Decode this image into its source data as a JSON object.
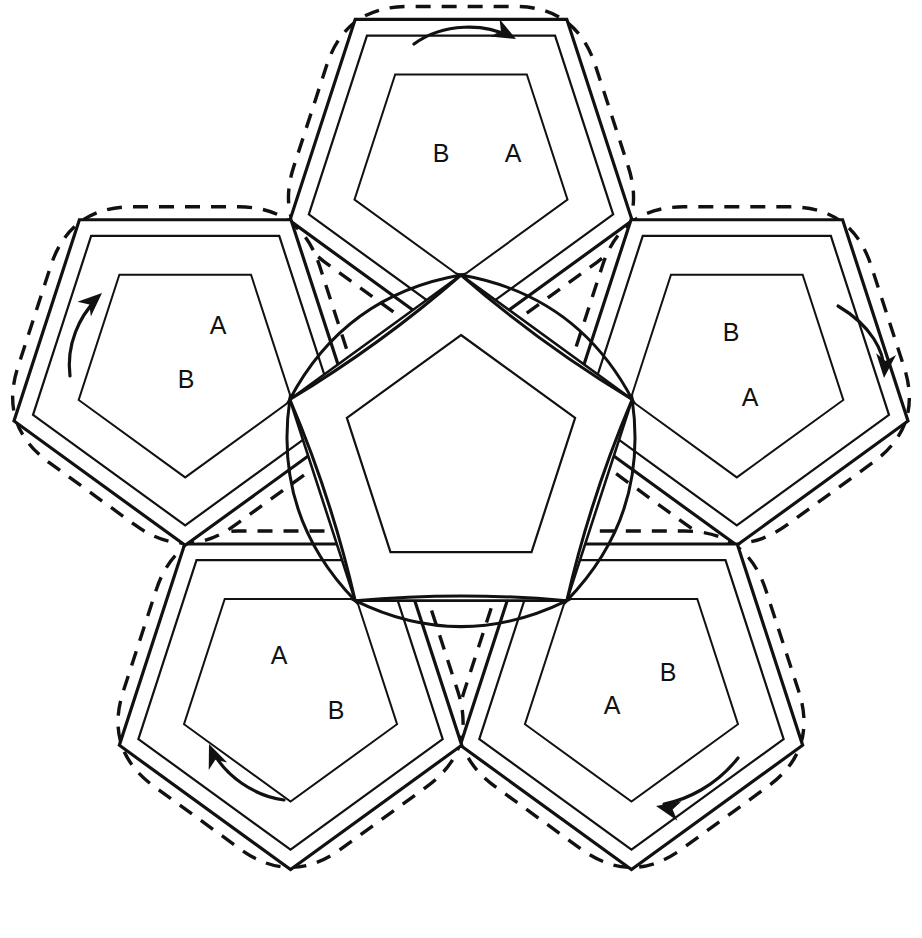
{
  "figure": {
    "background": "#ffffff",
    "stroke_color": "#111111",
    "module_count": 5,
    "arrow_count": 5,
    "label_text": {
      "a": "A",
      "b": "B"
    }
  },
  "labels": [
    {
      "id": "l1",
      "text": "B",
      "x": 441,
      "y": 155
    },
    {
      "id": "l2",
      "text": "A",
      "x": 513,
      "y": 155
    },
    {
      "id": "l3",
      "text": "A",
      "x": 218,
      "y": 327
    },
    {
      "id": "l4",
      "text": "B",
      "x": 186,
      "y": 381
    },
    {
      "id": "l5",
      "text": "B",
      "x": 731,
      "y": 334
    },
    {
      "id": "l6",
      "text": "A",
      "x": 750,
      "y": 399
    },
    {
      "id": "l7",
      "text": "A",
      "x": 279,
      "y": 657
    },
    {
      "id": "l8",
      "text": "B",
      "x": 336,
      "y": 712
    },
    {
      "id": "l9",
      "text": "B",
      "x": 668,
      "y": 674
    },
    {
      "id": "l10",
      "text": "A",
      "x": 612,
      "y": 707
    }
  ],
  "arrows": [
    {
      "id": "arrow-top",
      "direction": "clockwise-right",
      "path": "M 414 44 C 444 22 486 24 508 36",
      "tip_x": 516,
      "tip_y": 39,
      "tip_angle": 28
    },
    {
      "id": "arrow-right",
      "direction": "clockwise-down",
      "path": "M 838 306 C 872 326 884 352 884 370",
      "tip_x": 884,
      "tip_y": 378,
      "tip_angle": 95
    },
    {
      "id": "arrow-bottom-right",
      "direction": "clockwise-left",
      "path": "M 738 758 C 716 786 686 800 664 804",
      "tip_x": 656,
      "tip_y": 806,
      "tip_angle": 192
    },
    {
      "id": "arrow-bottom-left",
      "direction": "clockwise-upleft",
      "path": "M 284 800 C 254 796 226 776 213 752",
      "tip_x": 209,
      "tip_y": 744,
      "tip_angle": 248
    },
    {
      "id": "arrow-left",
      "direction": "clockwise-up",
      "path": "M 70 376 C 66 344 80 316 96 300",
      "tip_x": 102,
      "tip_y": 293,
      "tip_angle": 318
    }
  ],
  "geometry": {
    "center_x": 461,
    "center_y": 455,
    "core_outer_radius": 180,
    "core_inner_radius": 120,
    "module_distance": 290,
    "module_outer_radius": 180,
    "module_mid_radius": 160,
    "module_inner_radius": 112,
    "module_dash_radius": 196,
    "lens_width": 52
  }
}
